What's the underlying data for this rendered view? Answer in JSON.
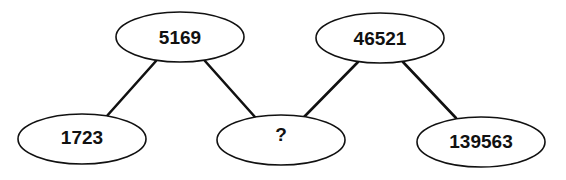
{
  "diagram": {
    "type": "number-tree-puzzle",
    "nodes": [
      {
        "id": "top-left",
        "label": "5169"
      },
      {
        "id": "top-right",
        "label": "46521"
      },
      {
        "id": "bottom-left",
        "label": "1723"
      },
      {
        "id": "bottom-middle",
        "label": "?"
      },
      {
        "id": "bottom-right",
        "label": "139563"
      }
    ],
    "edges": [
      {
        "from": "top-left",
        "to": "bottom-left"
      },
      {
        "from": "top-left",
        "to": "bottom-middle"
      },
      {
        "from": "top-right",
        "to": "bottom-middle"
      },
      {
        "from": "top-right",
        "to": "bottom-right"
      }
    ]
  }
}
